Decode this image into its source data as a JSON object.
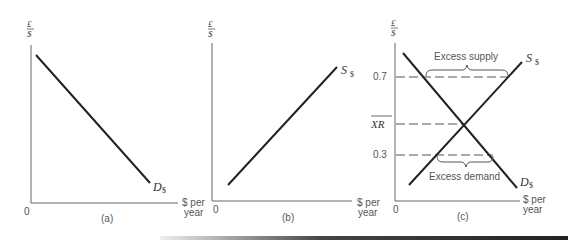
{
  "panels": {
    "a": {
      "y_axis_label_top": "£",
      "y_axis_label_bottom": "$",
      "origin": "0",
      "curve_label": "D",
      "curve_sub": "$",
      "caption": "(a)"
    },
    "b": {
      "y_axis_label_top": "£",
      "y_axis_label_bottom": "$",
      "origin": "0",
      "x_axis_label_line1": "$ per",
      "x_axis_label_line2": "year",
      "x_axis_label_left_line1": "$ per",
      "x_axis_label_left_line2": "year",
      "curve_label": "S",
      "curve_sub": "$",
      "caption": "(b)"
    },
    "c": {
      "y_axis_label_top": "£",
      "y_axis_label_bottom": "$",
      "origin": "0",
      "x_axis_label_left_line1": "$ per",
      "x_axis_label_left_line2": "year",
      "x_axis_label_line1": "$ per",
      "x_axis_label_line2": "year",
      "tick_high": "0.7",
      "tick_eq": "XR",
      "tick_low": "0.3",
      "supply_label": "S",
      "supply_sub": "$",
      "demand_label": "D",
      "demand_sub": "$",
      "excess_supply": "Excess supply",
      "excess_demand": "Excess demand",
      "caption": "(c)"
    }
  },
  "colors": {
    "curve": "#222222",
    "axis": "#666666",
    "text": "#555555"
  }
}
